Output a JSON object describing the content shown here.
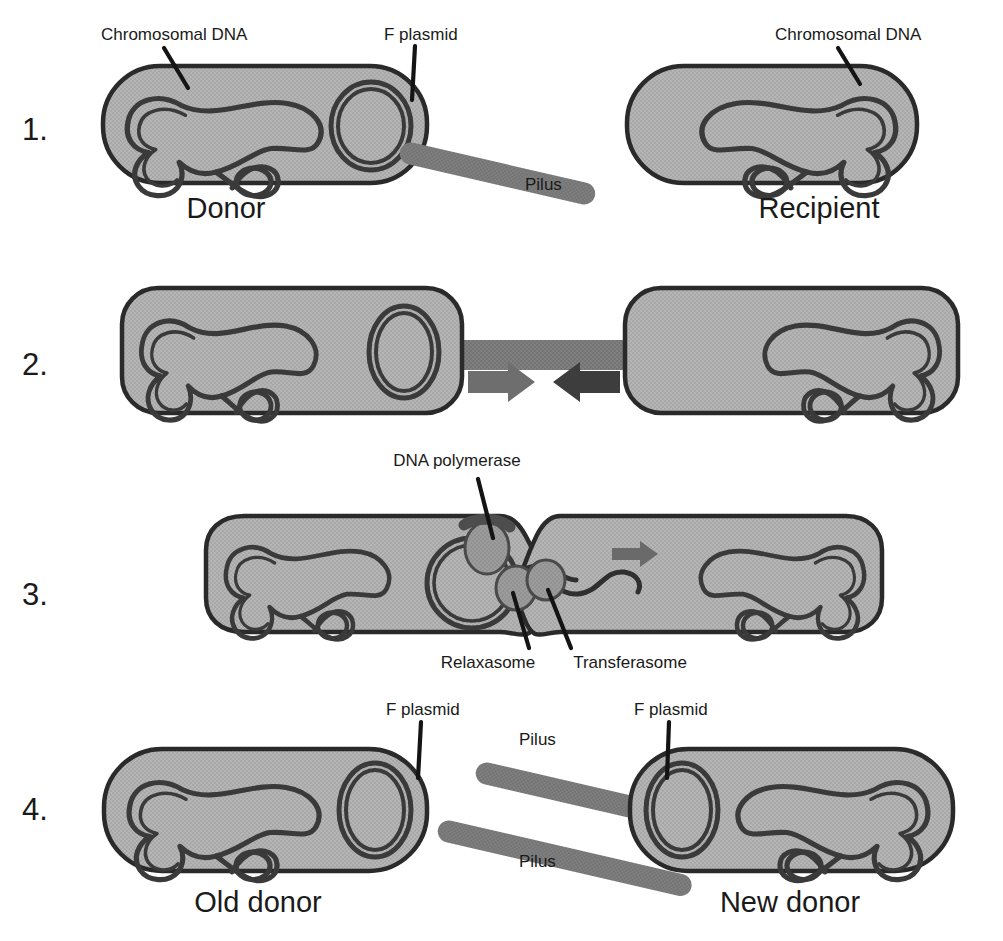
{
  "figure": {
    "background_color": "#ffffff",
    "width": 1003,
    "height": 941
  },
  "palette": {
    "cell_fill": "#b3b3b3",
    "cell_stroke": "#2a2a2a",
    "dna_stroke": "#3a3a3a",
    "pilus_fill": "#7d7d7d",
    "organelle_fill": "#9a9a9a",
    "arrow_light": "#6e6e6e",
    "arrow_dark": "#3d3d3d",
    "text_color": "#1a1a1a"
  },
  "steps": [
    {
      "number": "1.",
      "labels": {
        "chromosomal_dna_left": "Chromosomal DNA",
        "f_plasmid": "F plasmid",
        "pilus": "Pilus",
        "chromosomal_dna_right": "Chromosomal DNA"
      },
      "captions": {
        "left_cell": "Donor",
        "right_cell": "Recipient"
      }
    },
    {
      "number": "2.",
      "labels": {},
      "captions": {}
    },
    {
      "number": "3.",
      "labels": {
        "dna_polymerase": "DNA polymerase",
        "relaxasome": "Relaxasome",
        "transferasome": "Transferasome"
      },
      "captions": {}
    },
    {
      "number": "4.",
      "labels": {
        "f_plasmid_left": "F plasmid",
        "f_plasmid_right": "F plasmid",
        "pilus_top": "Pilus",
        "pilus_bottom": "Pilus"
      },
      "captions": {
        "left_cell": "Old donor",
        "right_cell": "New donor"
      }
    }
  ]
}
